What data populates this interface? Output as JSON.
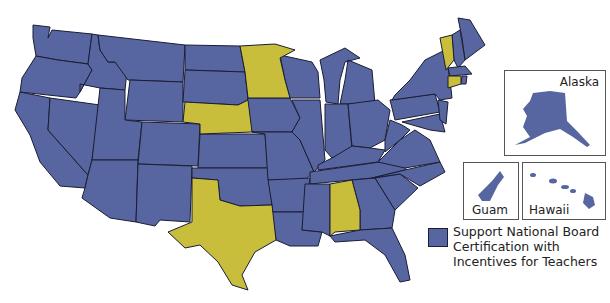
{
  "colors": {
    "support": "#5766a0",
    "other": "#c9bd3c",
    "border": "#1a1d33"
  },
  "highlighted_states": [
    "Minnesota",
    "Nebraska",
    "Texas",
    "Alabama",
    "Vermont",
    "Connecticut"
  ],
  "insets": {
    "alaska": "Alaska",
    "guam": "Guam",
    "hawaii": "Hawaii"
  },
  "legend": {
    "label": "Support National Board Certification with Incentives for Teachers"
  }
}
